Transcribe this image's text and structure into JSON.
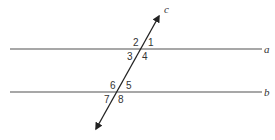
{
  "diagram": {
    "type": "parallel-lines-cut-by-transversal",
    "colors": {
      "line": "#8a8a8a",
      "transversal": "#222222",
      "text": "#333333"
    },
    "lines": [
      {
        "name": "a",
        "label": "a"
      },
      {
        "name": "b",
        "label": "b"
      }
    ],
    "transversal": {
      "name": "c",
      "label": "c"
    },
    "angles": {
      "a1": "1",
      "a2": "2",
      "a3": "3",
      "a4": "4",
      "b5": "5",
      "b6": "6",
      "b7": "7",
      "b8": "8"
    }
  }
}
